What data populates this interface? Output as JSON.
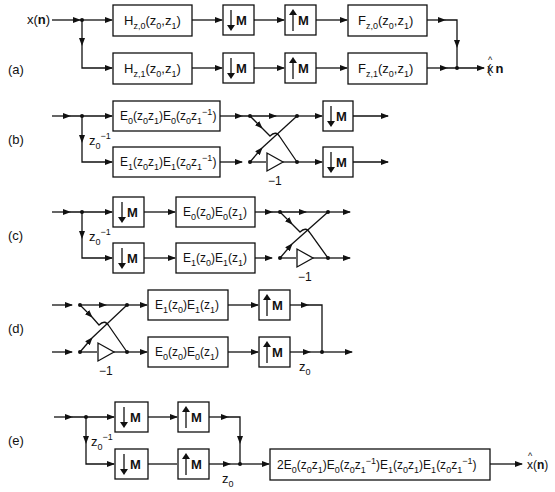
{
  "figure": {
    "panels": [
      {
        "id": "a",
        "label": "(a)",
        "input": "x(n)",
        "output": "x̂(n)",
        "analysis_filters": [
          {
            "name": "H",
            "sub": "z,0",
            "args": "(z0,z1)"
          },
          {
            "name": "H",
            "sub": "z,1",
            "args": "(z0,z1)"
          }
        ],
        "decimators": [
          "↓M",
          "↓M"
        ],
        "expanders": [
          "↑M",
          "↑M"
        ],
        "synthesis_filters": [
          {
            "name": "F",
            "sub": "z,0",
            "args": "(z0,z1)"
          },
          {
            "name": "F",
            "sub": "z,1",
            "args": "(z0,z1)"
          }
        ]
      },
      {
        "id": "b",
        "label": "(b)",
        "delay": "z0^-1",
        "filters": [
          "E0(z0z1)E0(z0z1^-1)",
          "E1(z0z1)E1(z0z1^-1)"
        ],
        "gain": "−1",
        "decimators": [
          "↓M",
          "↓M"
        ]
      },
      {
        "id": "c",
        "label": "(c)",
        "delay": "z0^-1",
        "decimators": [
          "↓M",
          "↓M"
        ],
        "filters": [
          "E0(z0)E0(z1)",
          "E1(z0)E1(z1)"
        ],
        "gain": "−1"
      },
      {
        "id": "d",
        "label": "(d)",
        "gain": "−1",
        "filters": [
          "E1(z0)E1(z1)",
          "E0(z0)E0(z1)"
        ],
        "expanders": [
          "↑M",
          "↑M"
        ],
        "delay": "z0"
      },
      {
        "id": "e",
        "label": "(e)",
        "delay_in": "z0^-1",
        "decimators": [
          "↓M",
          "↓M"
        ],
        "expanders": [
          "↑M",
          "↑M"
        ],
        "delay_out": "z0",
        "filter": "2E0(z0z1)E0(z0z1^-1)E1(z0z1)E1(z0z1^-1)",
        "output": "x̂(n)"
      }
    ],
    "text": {
      "x_in": "x(",
      "n": "n",
      "close": ")",
      "M": "M",
      "neg1": "−1",
      "z": "z",
      "E": "E",
      "H": "H",
      "F": "F",
      "s0": "0",
      "s1": "1",
      "sz0": "z,0",
      "sz1": "z,1",
      "m1": "−1",
      "two": "2",
      "lab_a": "(a)",
      "lab_b": "(b)",
      "lab_c": "(c)",
      "lab_d": "(d)",
      "lab_e": "(e)"
    }
  }
}
